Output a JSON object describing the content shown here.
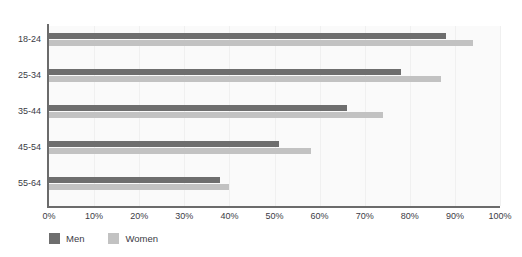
{
  "chart_data": {
    "type": "bar",
    "orientation": "horizontal",
    "title": "",
    "xlabel": "",
    "ylabel": "",
    "categories": [
      "18-24",
      "25-34",
      "35-44",
      "45-54",
      "55-64"
    ],
    "series": [
      {
        "name": "Men",
        "color": "#6e6e6e",
        "values": [
          88,
          78,
          66,
          51,
          38
        ]
      },
      {
        "name": "Women",
        "color": "#c2c2c2",
        "values": [
          94,
          87,
          74,
          58,
          40
        ]
      }
    ],
    "xlim": [
      0,
      100
    ],
    "xticks": [
      0,
      10,
      20,
      30,
      40,
      50,
      60,
      70,
      80,
      90,
      100
    ],
    "xtick_labels": [
      "0%",
      "10%",
      "20%",
      "30%",
      "40%",
      "50%",
      "60%",
      "70%",
      "80%",
      "90%",
      "100%"
    ],
    "grid": true,
    "grid_axis": "x",
    "legend_position": "bottom-left",
    "value_suffix": "%"
  },
  "legend": {
    "items": [
      {
        "label": "Men",
        "color": "#6e6e6e"
      },
      {
        "label": "Women",
        "color": "#c2c2c2"
      }
    ]
  },
  "colors": {
    "men": "#6e6e6e",
    "women": "#c2c2c2",
    "axis": "#6b6b6b",
    "plot_background": "#fafafa",
    "gridline": "#f0f0f0",
    "text": "#3b3b45"
  }
}
